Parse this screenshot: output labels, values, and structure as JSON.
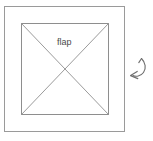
{
  "diagram": {
    "title": "flap",
    "background_color": "#ffffff",
    "line_color": "#9a9a9a",
    "label_color": "#4a4a4a",
    "arrow_color": "#6f6f6f",
    "labels": {
      "flap": "flap"
    },
    "shapes": {
      "outer_frame": {
        "name": "outer-rectangle",
        "x": 4,
        "y": 6,
        "width": 121,
        "height": 126
      },
      "inner_square": {
        "name": "inner-square",
        "x": 21,
        "y": 23,
        "width": 88,
        "height": 92
      },
      "diagonals": {
        "name": "x-diagonals",
        "count": 2,
        "center_x": 65,
        "center_y": 69
      },
      "rotate_arrow": {
        "name": "curved-rotate-arrow",
        "x": 128,
        "y": 56,
        "width": 20,
        "height": 26,
        "direction": "counterclockwise-down-left"
      }
    }
  }
}
